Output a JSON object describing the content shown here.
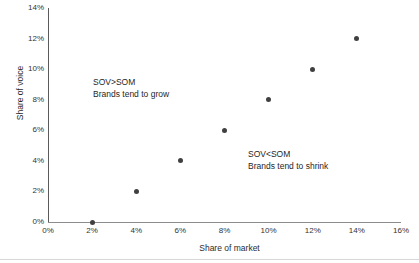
{
  "chart_data": {
    "type": "scatter",
    "title": "",
    "xlabel": "Share of market",
    "ylabel": "Share of voice",
    "xlim": [
      0,
      16
    ],
    "ylim": [
      0,
      14
    ],
    "xticks": [
      "0%",
      "2%",
      "4%",
      "6%",
      "8%",
      "10%",
      "12%",
      "14%",
      "16%"
    ],
    "xtick_values": [
      0,
      2,
      4,
      6,
      8,
      10,
      12,
      14,
      16
    ],
    "yticks": [
      "0%",
      "2%",
      "4%",
      "6%",
      "8%",
      "10%",
      "12%",
      "14%"
    ],
    "ytick_values": [
      0,
      2,
      4,
      6,
      8,
      10,
      12,
      14
    ],
    "grid": false,
    "legend": "none",
    "marker_color": "#404040",
    "axis_color": "#5a5a5a",
    "points": [
      {
        "x": 2,
        "y": 0
      },
      {
        "x": 4,
        "y": 2
      },
      {
        "x": 6,
        "y": 4
      },
      {
        "x": 8,
        "y": 6
      },
      {
        "x": 10,
        "y": 8
      },
      {
        "x": 12,
        "y": 10
      },
      {
        "x": 14,
        "y": 12
      }
    ],
    "annotations": [
      {
        "id": "grow",
        "line1": "SOV>SOM",
        "line2": "Brands tend to grow"
      },
      {
        "id": "shrink",
        "line1": "SOV<SOM",
        "line2": "Brands tend to shrink"
      }
    ]
  }
}
